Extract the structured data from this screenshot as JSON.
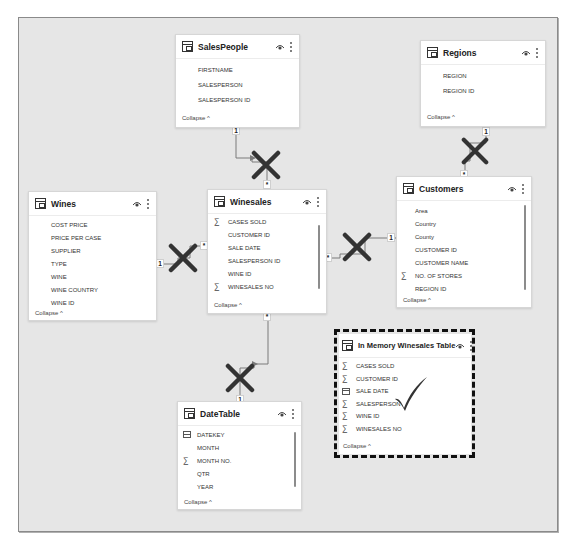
{
  "tables": {
    "salespeople": {
      "title": "SalesPeople",
      "fields": [
        {
          "name": "FIRSTNAME",
          "icon": ""
        },
        {
          "name": "SALESPERSON",
          "icon": ""
        },
        {
          "name": "SALESPERSON ID",
          "icon": ""
        }
      ],
      "collapse": "Collapse ^"
    },
    "regions": {
      "title": "Regions",
      "fields": [
        {
          "name": "REGION",
          "icon": ""
        },
        {
          "name": "REGION ID",
          "icon": ""
        }
      ],
      "collapse": "Collapse ^"
    },
    "wines": {
      "title": "Wines",
      "fields": [
        {
          "name": "COST PRICE",
          "icon": ""
        },
        {
          "name": "PRICE PER CASE",
          "icon": ""
        },
        {
          "name": "SUPPLIER",
          "icon": ""
        },
        {
          "name": "TYPE",
          "icon": ""
        },
        {
          "name": "WINE",
          "icon": ""
        },
        {
          "name": "WINE COUNTRY",
          "icon": ""
        },
        {
          "name": "WINE ID",
          "icon": ""
        }
      ],
      "collapse": "Collapse ^"
    },
    "winesales": {
      "title": "Winesales",
      "fields": [
        {
          "name": "CASES SOLD",
          "icon": "sigma"
        },
        {
          "name": "CUSTOMER ID",
          "icon": ""
        },
        {
          "name": "SALE DATE",
          "icon": ""
        },
        {
          "name": "SALESPERSON ID",
          "icon": ""
        },
        {
          "name": "WINE ID",
          "icon": ""
        },
        {
          "name": "WINESALES NO",
          "icon": "sigma"
        }
      ],
      "collapse": "Collapse ^"
    },
    "customers": {
      "title": "Customers",
      "fields": [
        {
          "name": "Area",
          "icon": ""
        },
        {
          "name": "Country",
          "icon": ""
        },
        {
          "name": "County",
          "icon": ""
        },
        {
          "name": "CUSTOMER ID",
          "icon": ""
        },
        {
          "name": "CUSTOMER NAME",
          "icon": ""
        },
        {
          "name": "NO. OF STORES",
          "icon": "sigma"
        },
        {
          "name": "REGION ID",
          "icon": ""
        }
      ],
      "collapse": "Collapse ^"
    },
    "in_memory": {
      "title": "In Memory Winesales Table",
      "fields": [
        {
          "name": "CASES SOLD",
          "icon": "sigma"
        },
        {
          "name": "CUSTOMER ID",
          "icon": "sigma"
        },
        {
          "name": "SALE DATE",
          "icon": "calendar"
        },
        {
          "name": "SALESPERSON",
          "icon": "sigma"
        },
        {
          "name": "WINE ID",
          "icon": "sigma"
        },
        {
          "name": "WINESALES NO",
          "icon": "sigma"
        }
      ],
      "collapse": "Collapse ^"
    },
    "datetable": {
      "title": "DateTable",
      "fields": [
        {
          "name": "DATEKEY",
          "icon": "calendar"
        },
        {
          "name": "MONTH",
          "icon": ""
        },
        {
          "name": "MONTH NO.",
          "icon": "sigma"
        },
        {
          "name": "QTR",
          "icon": ""
        },
        {
          "name": "YEAR",
          "icon": ""
        }
      ],
      "collapse": "Collapse ^"
    }
  },
  "relationships": [
    {
      "from": "SalesPeople",
      "to": "Winesales",
      "one_label": "1",
      "many_label": "*",
      "status": "crossed-out"
    },
    {
      "from": "Wines",
      "to": "Winesales",
      "one_label": "1",
      "many_label": "*",
      "status": "crossed-out"
    },
    {
      "from": "Customers",
      "to": "Winesales",
      "one_label": "1",
      "many_label": "*",
      "status": "crossed-out"
    },
    {
      "from": "Regions",
      "to": "Customers",
      "one_label": "1",
      "many_label": "*",
      "status": "crossed-out"
    },
    {
      "from": "DateTable",
      "to": "Winesales",
      "one_label": "1",
      "many_label": "*",
      "status": "crossed-out"
    }
  ],
  "annotations": {
    "highlight": "In Memory Winesales Table",
    "mark": "checkmark"
  },
  "colors": {
    "canvas": "#e6e6e6",
    "card": "#ffffff",
    "line": "#7a7a7a",
    "xmark": "#333333",
    "check": "#333333",
    "dash": "#111111"
  }
}
